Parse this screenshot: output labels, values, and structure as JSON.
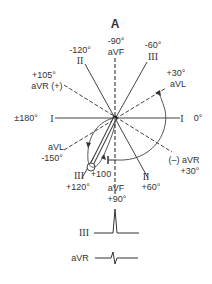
{
  "title": "A",
  "leads": {
    "aVF_top": {
      "lead": "aVF",
      "angle": "-90°"
    },
    "II_top": {
      "lead": "II",
      "angle": "-120°"
    },
    "III_top": {
      "lead": "III",
      "angle": "-60°"
    },
    "aVR_pos": {
      "lead": "aVR (+)",
      "angle": "+105°"
    },
    "aVL_pos": {
      "lead": "aVL",
      "angle": "+30°"
    },
    "I_left": {
      "lead": "I",
      "angle": "±180°"
    },
    "I_right": {
      "lead": "I",
      "angle": "0°"
    },
    "aVL_neg": {
      "lead": "aVL",
      "angle": "-150°"
    },
    "aVR_neg": {
      "lead": "(–) aVR",
      "angle": "+30°"
    },
    "III_bottom": {
      "lead": "III",
      "angle": "+120°"
    },
    "aVF_bottom": {
      "lead": "aVF",
      "angle": "+90°"
    },
    "II_bottom": {
      "lead": "II",
      "angle": "+60°"
    }
  },
  "axis_marker": "+100",
  "traces": [
    {
      "lead": "III",
      "shape": "tall-positive-spike"
    },
    {
      "lead": "aVR",
      "shape": "small-biphasic"
    }
  ]
}
